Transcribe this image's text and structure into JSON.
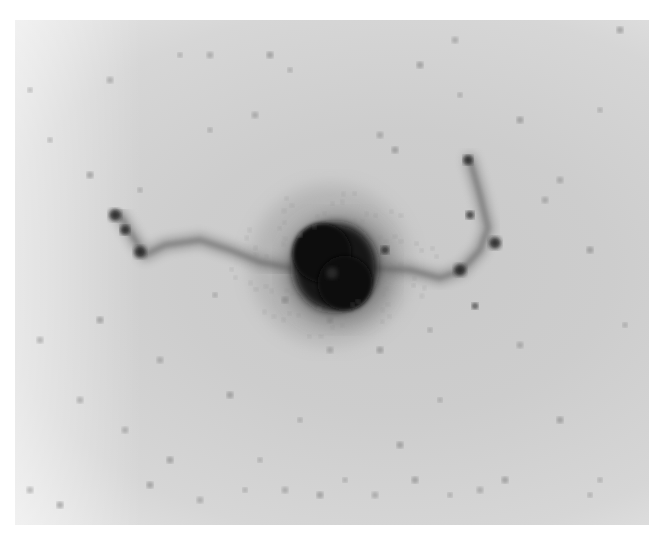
{
  "image": {
    "description": "Grayscale negative photographic plate of a galaxy with bright central bulge and two curved arms",
    "colors": {
      "background": "#cfcfcf",
      "core": "#111111",
      "stars": "#7a7a7a"
    }
  },
  "core": {
    "cx": 330,
    "cy": 265,
    "r": 42
  },
  "arms": [
    {
      "name": "left-arm",
      "points": [
        [
          120,
          215
        ],
        [
          135,
          240
        ],
        [
          145,
          255
        ],
        [
          165,
          245
        ],
        [
          200,
          240
        ],
        [
          230,
          250
        ],
        [
          260,
          262
        ],
        [
          290,
          268
        ]
      ]
    },
    {
      "name": "right-arm",
      "points": [
        [
          370,
          268
        ],
        [
          410,
          270
        ],
        [
          440,
          278
        ],
        [
          462,
          270
        ],
        [
          480,
          250
        ],
        [
          488,
          228
        ],
        [
          480,
          195
        ],
        [
          470,
          160
        ]
      ]
    }
  ],
  "arm_knots": [
    [
      115,
      215,
      6
    ],
    [
      125,
      230,
      5
    ],
    [
      140,
      252,
      6
    ],
    [
      460,
      270,
      6
    ],
    [
      495,
      243,
      6
    ],
    [
      470,
      215,
      4
    ],
    [
      468,
      160,
      5
    ],
    [
      475,
      306,
      3
    ],
    [
      385,
      250,
      4
    ]
  ],
  "stars": [
    [
      180,
      55
    ],
    [
      210,
      55
    ],
    [
      270,
      55
    ],
    [
      290,
      70
    ],
    [
      255,
      115
    ],
    [
      420,
      65
    ],
    [
      460,
      95
    ],
    [
      110,
      80
    ],
    [
      90,
      175
    ],
    [
      210,
      130
    ],
    [
      380,
      135
    ],
    [
      395,
      150
    ],
    [
      140,
      190
    ],
    [
      560,
      180
    ],
    [
      590,
      250
    ],
    [
      625,
      325
    ],
    [
      40,
      340
    ],
    [
      100,
      320
    ],
    [
      215,
      295
    ],
    [
      160,
      360
    ],
    [
      230,
      395
    ],
    [
      300,
      420
    ],
    [
      330,
      350
    ],
    [
      380,
      350
    ],
    [
      430,
      330
    ],
    [
      520,
      345
    ],
    [
      560,
      420
    ],
    [
      600,
      480
    ],
    [
      125,
      430
    ],
    [
      170,
      460
    ],
    [
      245,
      490
    ],
    [
      285,
      490
    ],
    [
      320,
      495
    ],
    [
      345,
      480
    ],
    [
      375,
      495
    ],
    [
      415,
      480
    ],
    [
      450,
      495
    ],
    [
      480,
      490
    ],
    [
      505,
      480
    ],
    [
      590,
      495
    ],
    [
      30,
      490
    ],
    [
      60,
      505
    ],
    [
      50,
      140
    ],
    [
      455,
      40
    ],
    [
      620,
      30
    ],
    [
      600,
      110
    ],
    [
      545,
      200
    ],
    [
      520,
      120
    ],
    [
      30,
      90
    ],
    [
      80,
      400
    ],
    [
      400,
      445
    ],
    [
      260,
      460
    ],
    [
      200,
      500
    ],
    [
      150,
      485
    ],
    [
      440,
      400
    ],
    [
      330,
      320
    ],
    [
      285,
      300
    ],
    [
      300,
      235
    ]
  ]
}
